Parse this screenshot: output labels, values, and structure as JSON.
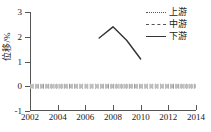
{
  "chart_data": {
    "type": "line",
    "title": "",
    "xlabel": "",
    "ylabel": "位移/%",
    "xlim": [
      2002,
      2014
    ],
    "ylim": [
      -1,
      3
    ],
    "xticks": [
      2002,
      2004,
      2006,
      2008,
      2010,
      2012,
      2014
    ],
    "yticks": [
      3,
      2,
      1,
      0,
      -1
    ],
    "xtick_labels": [
      "2002",
      "2004",
      "2006",
      "2008",
      "2010",
      "2012",
      "2014"
    ],
    "ytick_labels": [
      "3",
      "2",
      "1",
      "0",
      "-1"
    ],
    "grid": false,
    "legend_position": "top-right",
    "series": [
      {
        "name": "上游",
        "style": "dotted",
        "color": "#9a9a9a",
        "x": [
          2002,
          2003,
          2004,
          2005,
          2006,
          2007,
          2008,
          2009,
          2010,
          2011,
          2012,
          2013,
          2014
        ],
        "values": [
          0,
          0,
          0,
          0,
          0,
          0,
          0,
          0,
          0,
          0,
          0,
          0,
          0
        ]
      },
      {
        "name": "中游",
        "style": "dashed",
        "color": "#bdbdbd",
        "x": [
          2002,
          2003,
          2004,
          2005,
          2006,
          2007,
          2008,
          2009,
          2010,
          2011,
          2012,
          2013,
          2014
        ],
        "values": [
          0,
          0,
          0,
          0,
          0,
          0,
          0,
          0,
          0,
          0,
          0,
          0,
          0
        ]
      },
      {
        "name": "下游",
        "style": "solid",
        "color": "#333333",
        "x": [
          2007,
          2008,
          2009,
          2010
        ],
        "values": [
          1.95,
          2.4,
          1.85,
          1.1
        ]
      }
    ]
  },
  "legend": {
    "items": [
      {
        "label": "上游",
        "style": "dotted"
      },
      {
        "label": "中游",
        "style": "dashed"
      },
      {
        "label": "下游",
        "style": "solid"
      }
    ]
  },
  "axis": {
    "y_title": "位移/%"
  }
}
